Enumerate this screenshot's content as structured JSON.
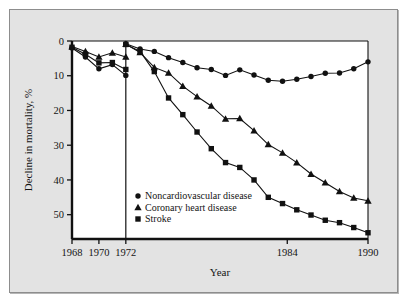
{
  "figure": {
    "panel_background": "#e3e3e3",
    "plot_background": "#ffffff",
    "border_color": "#8d8d8d",
    "ink_color": "#111111"
  },
  "chart_data": {
    "type": "line",
    "title": "",
    "xlabel": "Year",
    "ylabel": "Decline in mortality, %",
    "xlim": [
      1968,
      1990
    ],
    "ylim": [
      0,
      57
    ],
    "y_inverted": true,
    "grid": false,
    "legend_position": "inside-lower-left",
    "x_ticks": [
      1968,
      1970,
      1972,
      1984,
      1990
    ],
    "x_tick_labels": [
      "1968",
      "1970",
      "1972",
      "1984",
      "1990"
    ],
    "y_ticks": [
      0,
      10,
      20,
      30,
      40,
      50
    ],
    "y_tick_labels": [
      "0",
      "10",
      "20",
      "30",
      "40",
      "50"
    ],
    "reference_line_x": 1972,
    "series": [
      {
        "name": "Noncardiovascular disease",
        "marker": "circle",
        "x": [
          1968,
          1969,
          1970,
          1971,
          1972,
          1973,
          1974,
          1975,
          1976,
          1977,
          1978,
          1979,
          1980,
          1981,
          1982,
          1983,
          1984,
          1985,
          1986,
          1987,
          1988,
          1989,
          1990
        ],
        "values": [
          2.0,
          4.6,
          8.0,
          6.8,
          9.9,
          0.8,
          2.3,
          3.0,
          4.8,
          6.2,
          7.7,
          8.2,
          9.9,
          8.3,
          9.8,
          11.3,
          11.6,
          11.0,
          10.2,
          9.3,
          9.2,
          8.0,
          6.0
        ]
      },
      {
        "name": "Coronary heart disease",
        "marker": "triangle",
        "x": [
          1968,
          1969,
          1970,
          1971,
          1972,
          1973,
          1974,
          1975,
          1976,
          1977,
          1978,
          1979,
          1980,
          1981,
          1982,
          1983,
          1984,
          1985,
          1986,
          1987,
          1988,
          1989,
          1990
        ],
        "values": [
          1.6,
          3.0,
          4.6,
          3.4,
          4.6,
          0.9,
          3.3,
          7.6,
          9.2,
          13.0,
          16.0,
          18.7,
          22.4,
          22.3,
          25.8,
          29.8,
          32.2,
          35.0,
          38.3,
          40.8,
          43.3,
          45.2,
          46.0
        ]
      },
      {
        "name": "Stroke",
        "marker": "square",
        "x": [
          1968,
          1969,
          1970,
          1971,
          1972,
          1973,
          1974,
          1975,
          1976,
          1977,
          1978,
          1979,
          1980,
          1981,
          1982,
          1983,
          1984,
          1985,
          1986,
          1987,
          1988,
          1989,
          1990
        ],
        "values": [
          1.8,
          3.8,
          6.3,
          6.2,
          8.2,
          1.0,
          3.0,
          8.8,
          16.4,
          21.2,
          26.2,
          31.0,
          35.0,
          36.4,
          40.0,
          45.0,
          46.8,
          48.6,
          50.1,
          51.6,
          52.3,
          53.7,
          55.2
        ]
      }
    ],
    "legend": [
      {
        "marker": "circle",
        "label": "Noncardiovascular disease"
      },
      {
        "marker": "triangle",
        "label": "Coronary heart disease"
      },
      {
        "marker": "square",
        "label": "Stroke"
      }
    ]
  }
}
